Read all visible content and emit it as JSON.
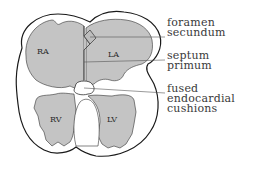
{
  "diagram": {
    "chambers": [
      {
        "id": "ra",
        "label": "RA",
        "x": 37,
        "y": 51
      },
      {
        "id": "la",
        "label": "LA",
        "x": 111,
        "y": 56
      },
      {
        "id": "rv",
        "label": "RV",
        "x": 57,
        "y": 120
      },
      {
        "id": "lv",
        "label": "LV",
        "x": 116,
        "y": 120
      }
    ],
    "callouts": [
      {
        "id": "foramen-secundum",
        "lines": "foramen\nsecundum",
        "x": 167,
        "y": 21
      },
      {
        "id": "septum-primum",
        "lines": "septum\nprimum",
        "x": 167,
        "y": 53
      },
      {
        "id": "fused-endocardial-cushions",
        "lines": "fused\nendocardial\ncushions",
        "x": 167,
        "y": 86
      }
    ],
    "colors": {
      "chamber_fill": "#c4c4c4",
      "outline": "#1a1a1a",
      "leader_line": "#555555"
    }
  }
}
